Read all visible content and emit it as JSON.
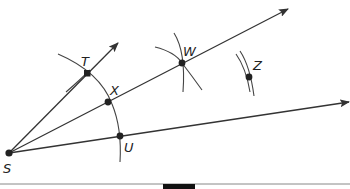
{
  "diagram": {
    "type": "geometric-construction",
    "colors": {
      "line": "#333333",
      "point": "#222222",
      "label": "#222222"
    },
    "points": [
      {
        "id": "S",
        "label": "S",
        "x": 9,
        "y": 153,
        "label_x": 3,
        "label_y": 173
      },
      {
        "id": "T",
        "label": "T",
        "x": 87,
        "y": 73,
        "label_x": 81,
        "label_y": 66
      },
      {
        "id": "X",
        "label": "X",
        "x": 108,
        "y": 102,
        "label_x": 110,
        "label_y": 95
      },
      {
        "id": "W",
        "label": "W",
        "x": 182,
        "y": 63,
        "label_x": 183,
        "label_y": 56
      },
      {
        "id": "Z",
        "label": "Z",
        "x": 249,
        "y": 77,
        "label_x": 253,
        "label_y": 70
      },
      {
        "id": "U",
        "label": "U",
        "x": 120,
        "y": 136,
        "label_x": 124,
        "label_y": 152
      }
    ],
    "rays": [
      {
        "name": "ray-ST",
        "from": "S",
        "through": "T"
      },
      {
        "name": "ray-SW",
        "from": "S",
        "through": "W"
      },
      {
        "name": "ray-SU",
        "from": "S",
        "through": "U"
      }
    ]
  }
}
